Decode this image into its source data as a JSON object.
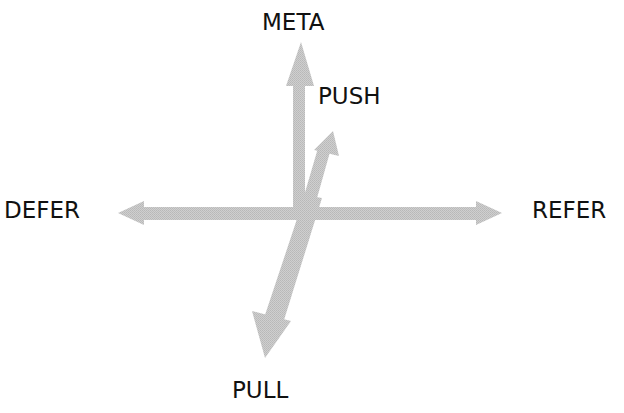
{
  "diagram": {
    "labels": {
      "meta": "META",
      "push": "PUSH",
      "defer": "DEFER",
      "refer": "REFER",
      "pull": "PULL"
    },
    "arrow_color": "#c4c4c4",
    "text_color": "#111111",
    "arrows": [
      {
        "name": "meta",
        "from": [
          299,
          215
        ],
        "to": [
          299,
          42
        ]
      },
      {
        "name": "defer",
        "from": [
          299,
          213
        ],
        "to": [
          118,
          213
        ]
      },
      {
        "name": "refer",
        "from": [
          299,
          213
        ],
        "to": [
          502,
          213
        ]
      },
      {
        "name": "push",
        "from": [
          300,
          225
        ],
        "to": [
          333,
          131
        ]
      },
      {
        "name": "pull",
        "from": [
          312,
          200
        ],
        "to": [
          265,
          358
        ]
      }
    ]
  }
}
